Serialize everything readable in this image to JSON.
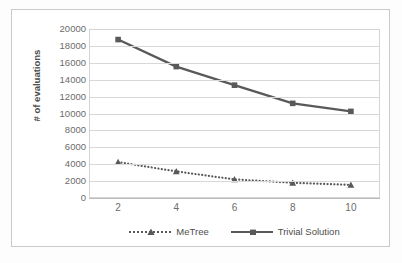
{
  "chart_data": {
    "type": "line",
    "title": "",
    "xlabel": "",
    "ylabel": "# of evaluations",
    "x": [
      2,
      4,
      6,
      8,
      10
    ],
    "xtick_labels": [
      "2",
      "4",
      "6",
      "8",
      "10"
    ],
    "xlim": [
      1,
      11
    ],
    "ylim": [
      0,
      20000
    ],
    "ytick_labels": [
      "20000",
      "18000",
      "16000",
      "14000",
      "12000",
      "10000",
      "8000",
      "6000",
      "4000",
      "2000",
      "0"
    ],
    "ytick_values": [
      20000,
      18000,
      16000,
      14000,
      12000,
      10000,
      8000,
      6000,
      4000,
      2000,
      0
    ],
    "grid": true,
    "legend_position": "bottom",
    "series": [
      {
        "name": "MeTree",
        "values": [
          4250,
          3150,
          2200,
          1800,
          1550
        ],
        "linestyle": "dotted",
        "marker": "triangle",
        "color": "#595959"
      },
      {
        "name": "Trivial Solution",
        "values": [
          18750,
          15550,
          13350,
          11200,
          10250
        ],
        "linestyle": "solid",
        "marker": "square",
        "color": "#595959"
      }
    ]
  },
  "legend": {
    "items": [
      {
        "label": "MeTree"
      },
      {
        "label": "Trivial Solution"
      }
    ]
  },
  "axes": {
    "y_title": "# of evaluations"
  },
  "colors": {
    "line": "#595959",
    "grid": "#d8d8d8",
    "text": "#6b6b6b",
    "frame": "#c9c9c9",
    "background": "#ffffff"
  }
}
